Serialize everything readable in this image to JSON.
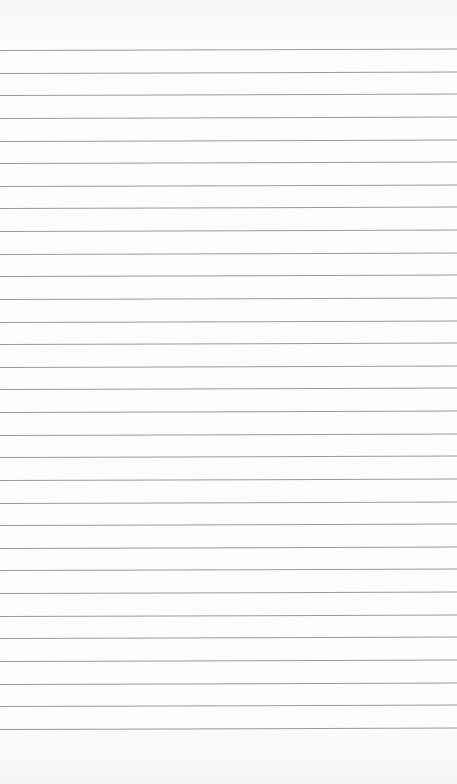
{
  "paper": {
    "type": "lined-paper",
    "background_color": "#fdfdfd",
    "line_color": "#9a9a9a",
    "first_line_y": 50,
    "line_spacing": 22.63,
    "line_count": 31
  }
}
